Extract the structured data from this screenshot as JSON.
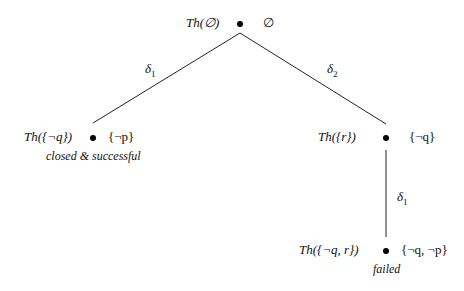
{
  "diagram": {
    "type": "tree",
    "nodes": [
      {
        "id": "root",
        "theory": "Th(∅)",
        "set": "∅",
        "status": ""
      },
      {
        "id": "left",
        "theory": "Th({¬q})",
        "set": "{¬p}",
        "status": "closed & successful"
      },
      {
        "id": "right",
        "theory": "Th({r})",
        "set": "{¬q}",
        "status": ""
      },
      {
        "id": "bottom",
        "theory": "Th({¬q, r})",
        "set": "{¬q, ¬p}",
        "status": "failed"
      }
    ],
    "edges": [
      {
        "from": "root",
        "to": "left",
        "label": "δ",
        "sub": "1"
      },
      {
        "from": "root",
        "to": "right",
        "label": "δ",
        "sub": "2"
      },
      {
        "from": "right",
        "to": "bottom",
        "label": "δ",
        "sub": "1"
      }
    ]
  }
}
